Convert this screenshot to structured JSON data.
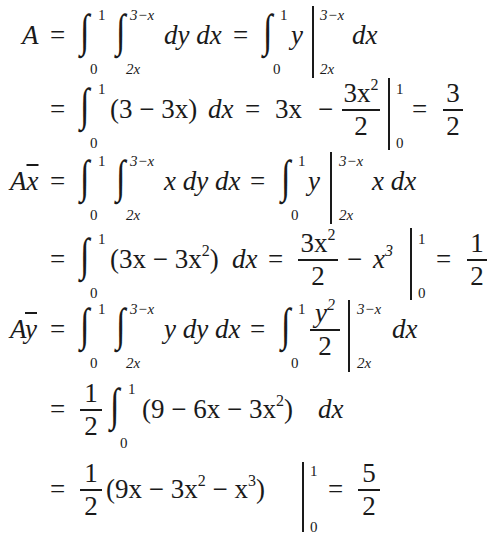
{
  "document": {
    "type": "centroid-calculation",
    "lines": [
      {
        "lhs": "A",
        "expr": "∫₀¹ ∫₂ₓ^(3−x) dy dx = ∫₀¹ y |₂ₓ^(3−x) dx"
      },
      {
        "lhs": "",
        "expr": "= ∫₀¹ (3 − 3x) dx = 3x − 3x²/2 |₀¹ = 3/2"
      },
      {
        "lhs": "Ax̄",
        "expr": "∫₀¹ ∫₂ₓ^(3−x) x dy dx = ∫₀¹ y |₂ₓ^(3−x) x dx"
      },
      {
        "lhs": "",
        "expr": "= ∫₀¹ (3x − 3x²) dx = 3x²/2 − x³ |₀¹ = 1/2"
      },
      {
        "lhs": "Aȳ",
        "expr": "∫₀¹ ∫₂ₓ^(3−x) y dy dx = ∫₀¹ y²/2 |₂ₓ^(3−x) dx"
      },
      {
        "lhs": "",
        "expr": "= 1/2 ∫₀¹ (9 − 6x − 3x²) dx"
      },
      {
        "lhs": "",
        "expr": "= 1/2 (9x − 3x² − x³) |₀¹ = 5/2"
      }
    ],
    "symbols": {
      "A": "A",
      "x": "x",
      "y": "y",
      "eq": "=",
      "minus": "−",
      "integral": "∫",
      "dydx": "dy dx",
      "dx": "dx",
      "xdydx": "x dy dx",
      "ydydx": "y dy dx",
      "xdx": "x dx",
      "lim0": "0",
      "lim1": "1",
      "lim2x": "2x",
      "lim3mx": "3−x",
      "l2_paren": "(3 − 3x)",
      "l2_3x": "3x",
      "l2_num": "3x",
      "l2_den": "2",
      "r1_num": "3",
      "r1_den": "2",
      "l4_paren_a": "(3x − 3x",
      "l4_paren_b": ")",
      "l4_num": "3x",
      "l4_den": "2",
      "l4_x3": "x",
      "r2_num": "1",
      "r2_den": "2",
      "l5_num": "y",
      "l5_den": "2",
      "half_num": "1",
      "half_den": "2",
      "l6_a": "(9 − 6x − 3x",
      "l6_b": ")",
      "l7_a": "(9x − 3x",
      "l7_b": " − x",
      "l7_c": ")",
      "r3_num": "5",
      "r3_den": "2",
      "sq": "2",
      "cube": "3"
    }
  }
}
